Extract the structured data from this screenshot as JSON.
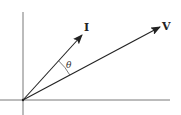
{
  "diagram": {
    "type": "phasor-diagram",
    "colors": {
      "axis": "#555555",
      "vector": "#222222",
      "background": "#ffffff"
    },
    "origin": [
      23,
      100
    ],
    "axes": {
      "horizontal": {
        "x1": 0,
        "x2": 170,
        "y": 100
      },
      "vertical": {
        "x": 23,
        "y1": 12,
        "y2": 115
      }
    },
    "vectors": [
      {
        "name": "I",
        "label": "I",
        "tip": [
          82,
          35
        ],
        "label_pos": [
          85,
          30
        ]
      },
      {
        "name": "V",
        "label": "V",
        "tip": [
          160,
          27
        ],
        "label_pos": [
          164,
          28
        ]
      }
    ],
    "angle": {
      "symbol": "θ",
      "between": [
        "I",
        "V"
      ],
      "label_pos": [
        66,
        66
      ]
    }
  }
}
